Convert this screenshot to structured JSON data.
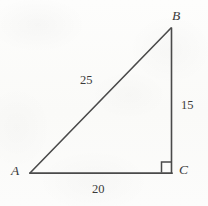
{
  "figure": {
    "kind": "right-triangle-geometry-diagram",
    "background_color": "#fcfcfb",
    "stroke_color": "#4a4a4a",
    "text_color": "#3a3a3a",
    "vertices": [
      {
        "id": "A",
        "label": "A",
        "x": 30,
        "y": 173
      },
      {
        "id": "B",
        "label": "B",
        "x": 171,
        "y": 28
      },
      {
        "id": "C",
        "label": "C",
        "x": 171,
        "y": 173
      }
    ],
    "sides": [
      {
        "id": "AB",
        "label": "25",
        "from": "A",
        "to": "B",
        "role": "hypotenuse"
      },
      {
        "id": "BC",
        "label": "15",
        "from": "B",
        "to": "C",
        "role": "leg-vertical"
      },
      {
        "id": "AC",
        "label": "20",
        "from": "A",
        "to": "C",
        "role": "leg-horizontal"
      }
    ],
    "right_angle": {
      "at_vertex": "C",
      "marker": "square",
      "size": 11
    }
  }
}
